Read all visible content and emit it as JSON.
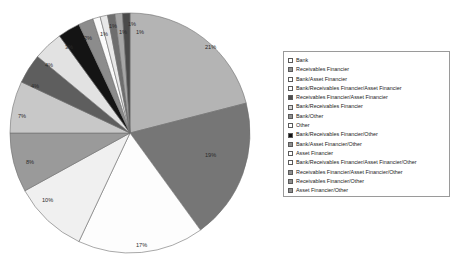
{
  "chart_data": {
    "type": "pie",
    "title": "",
    "legend_position": "right",
    "categories": [
      "Bank",
      "Receivables Financier",
      "Bank/Asset Financier",
      "Bank/Receivables Financier/Asset Financier",
      "Receivables Financier/Asset Financier",
      "Bank/Receivables Financier",
      "Bank/Other",
      "Other",
      "Bank/Receivables Financier/Other",
      "Bank/Asset Financier/Other",
      "Asset Financier",
      "Bank/Receivables Financier/Asset Financier/Other",
      "Receivables Financier/Asset Financier/Other",
      "Receivables Financier/Other",
      "Asset Financier/Other"
    ],
    "values": [
      21,
      19,
      17,
      10,
      8,
      7,
      4,
      4,
      3,
      2,
      1,
      1,
      1,
      1,
      1
    ],
    "value_labels": [
      "21%",
      "19%",
      "17%",
      "10%",
      "8%",
      "7%",
      "4%",
      "4%",
      "3%",
      "2%",
      "1%",
      "1%",
      "1%",
      "1%",
      "1%"
    ],
    "slice_colors": [
      "#b4b4b4",
      "#767676",
      "#fdfdfd",
      "#f0f0f0",
      "#9a9a9a",
      "#c8c8c8",
      "#5e5e5e",
      "#e2e2e2",
      "#141414",
      "#8c8c8c",
      "#fafafa",
      "#e8e8e8",
      "#6e6e6e",
      "#a6a6a6",
      "#4a4a4a"
    ]
  },
  "legend": {
    "items": [
      {
        "label": "Bank",
        "swatch": "#ffffff"
      },
      {
        "label": "Receivables Financier",
        "swatch": "#8f8f8f"
      },
      {
        "label": "Bank/Asset Financier",
        "swatch": "#ffffff"
      },
      {
        "label": "Bank/Receivables Financier/Asset Financier",
        "swatch": "#ffffff"
      },
      {
        "label": "Receivables Financier/Asset Financier",
        "swatch": "#4d4d4d"
      },
      {
        "label": "Bank/Receivables Financier",
        "swatch": "#d4d4d4"
      },
      {
        "label": "Bank/Other",
        "swatch": "#8f8f8f"
      },
      {
        "label": "Other",
        "swatch": "#ffffff"
      },
      {
        "label": "Bank/Receivables Financier/Other",
        "swatch": "#111111"
      },
      {
        "label": "Bank/Asset Financier/Other",
        "swatch": "#8f8f8f"
      },
      {
        "label": "Asset Financier",
        "swatch": "#ffffff"
      },
      {
        "label": "Bank/Receivables Financier/Asset Financier/Other",
        "swatch": "#ffffff"
      },
      {
        "label": "Receivables Financier/Asset Financier/Other",
        "swatch": "#8f8f8f"
      },
      {
        "label": "Receivables Financier/Other",
        "swatch": "#8f8f8f"
      },
      {
        "label": "Asset Financier/Other",
        "swatch": "#8f8f8f"
      }
    ]
  },
  "slice_label_positions": [
    {
      "text": "21%",
      "x": 205,
      "y": 45
    },
    {
      "text": "19%",
      "x": 205,
      "y": 153
    },
    {
      "text": "17%",
      "x": 136,
      "y": 243
    },
    {
      "text": "10%",
      "x": 42,
      "y": 198
    },
    {
      "text": "8%",
      "x": 26,
      "y": 160
    },
    {
      "text": "7%",
      "x": 18,
      "y": 114
    },
    {
      "text": "4%",
      "x": 31,
      "y": 84
    },
    {
      "text": "4%",
      "x": 45,
      "y": 63
    },
    {
      "text": "3%",
      "x": 65,
      "y": 45
    },
    {
      "text": "2%",
      "x": 84,
      "y": 36
    },
    {
      "text": "1%",
      "x": 100,
      "y": 32
    },
    {
      "text": "1%",
      "x": 109,
      "y": 24
    },
    {
      "text": "1%",
      "x": 119,
      "y": 30
    },
    {
      "text": "1%",
      "x": 128,
      "y": 22
    },
    {
      "text": "1%",
      "x": 136,
      "y": 30
    }
  ]
}
